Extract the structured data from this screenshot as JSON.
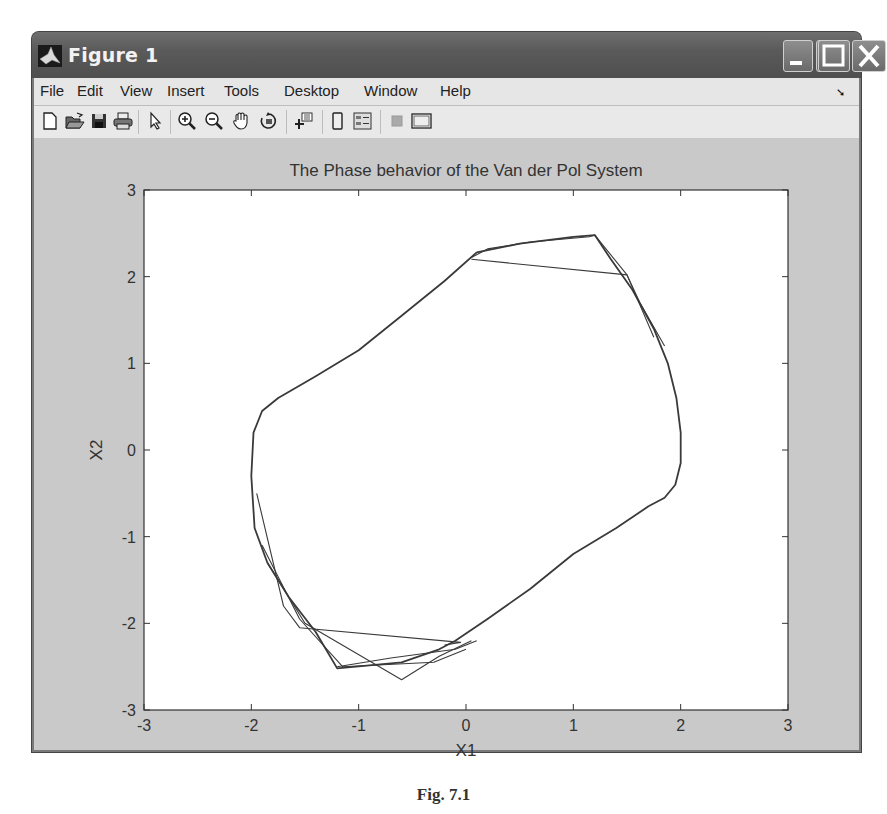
{
  "window": {
    "title": "Figure 1",
    "controls": {
      "minimize": "minimize",
      "maximize": "maximize",
      "close": "close"
    }
  },
  "menubar": {
    "items": [
      "File",
      "Edit",
      "View",
      "Insert",
      "Tools",
      "Desktop",
      "Window",
      "Help"
    ],
    "dock_arrow": "➘"
  },
  "toolbar": {
    "buttons": [
      {
        "name": "new-figure",
        "icon": "new-document-icon"
      },
      {
        "name": "open-file",
        "icon": "folder-open-icon"
      },
      {
        "name": "save-figure",
        "icon": "floppy-disk-icon"
      },
      {
        "name": "print-figure",
        "icon": "printer-icon"
      },
      {
        "name": "edit-plot",
        "icon": "arrow-pointer-icon"
      },
      {
        "name": "zoom-in",
        "icon": "zoom-in-icon"
      },
      {
        "name": "zoom-out",
        "icon": "zoom-out-icon"
      },
      {
        "name": "pan",
        "icon": "hand-icon"
      },
      {
        "name": "rotate-3d",
        "icon": "rotate-icon"
      },
      {
        "name": "data-cursor",
        "icon": "data-cursor-icon"
      },
      {
        "name": "insert-colorbar",
        "icon": "colorbar-icon"
      },
      {
        "name": "insert-legend",
        "icon": "legend-icon"
      },
      {
        "name": "hide-plot-tools",
        "icon": "hide-tools-icon"
      },
      {
        "name": "show-plot-tools",
        "icon": "show-tools-icon"
      }
    ]
  },
  "chart_data": {
    "type": "line",
    "title": "The Phase behavior of the Van der Pol System",
    "xlabel": "X1",
    "ylabel": "X2",
    "xlim": [
      -3,
      3
    ],
    "ylim": [
      -3,
      3
    ],
    "xticks": [
      -3,
      -2,
      -1,
      0,
      1,
      2,
      3
    ],
    "yticks": [
      -3,
      -2,
      -1,
      0,
      1,
      2,
      3
    ],
    "grid": false,
    "line_color": "#3a3a3a",
    "series": [
      {
        "name": "limit-cycle",
        "x": [
          0.1,
          0.5,
          1.0,
          1.2,
          1.35,
          1.55,
          1.75,
          1.88,
          1.96,
          2.0,
          2.0,
          1.95,
          1.85,
          1.7,
          1.4,
          1.0,
          0.6,
          0.2,
          -0.1,
          -0.25,
          -0.6,
          -1.2,
          -1.4,
          -1.65,
          -1.85,
          -1.97,
          -2.0,
          -1.98,
          -1.9,
          -1.75,
          -1.4,
          -1.0,
          -0.6,
          -0.2,
          0.1
        ],
        "y": [
          2.28,
          2.38,
          2.46,
          2.48,
          2.2,
          1.85,
          1.4,
          1.0,
          0.6,
          0.2,
          -0.15,
          -0.4,
          -0.55,
          -0.65,
          -0.9,
          -1.2,
          -1.6,
          -1.95,
          -2.2,
          -2.3,
          -2.45,
          -2.52,
          -2.1,
          -1.7,
          -1.3,
          -0.9,
          -0.3,
          0.2,
          0.45,
          0.6,
          0.85,
          1.15,
          1.55,
          1.95,
          2.28
        ]
      },
      {
        "name": "transient-1",
        "x": [
          0.05,
          0.2,
          0.6,
          1.15,
          1.2,
          1.5,
          1.75
        ],
        "y": [
          2.22,
          2.32,
          2.4,
          2.46,
          2.48,
          2.02,
          1.3
        ]
      },
      {
        "name": "transient-2",
        "x": [
          0.05,
          1.5,
          1.62,
          1.85
        ],
        "y": [
          2.2,
          2.02,
          1.7,
          1.2
        ]
      },
      {
        "name": "transient-3",
        "x": [
          -1.95,
          -1.7,
          -1.55,
          -0.05,
          -0.2
        ],
        "y": [
          -0.5,
          -1.8,
          -2.05,
          -2.22,
          -2.25
        ]
      },
      {
        "name": "transient-4",
        "x": [
          -1.85,
          -1.5,
          -0.6,
          -0.25,
          0.05
        ],
        "y": [
          -1.3,
          -2.0,
          -2.65,
          -2.38,
          -2.2
        ]
      },
      {
        "name": "transient-5",
        "x": [
          -1.9,
          -1.55,
          -1.15,
          -0.3,
          0.0
        ],
        "y": [
          -1.1,
          -1.95,
          -2.5,
          -2.45,
          -2.3
        ]
      },
      {
        "name": "transient-6",
        "x": [
          -1.2,
          -0.7,
          -0.1,
          0.1
        ],
        "y": [
          -2.5,
          -2.4,
          -2.3,
          -2.2
        ]
      }
    ]
  },
  "caption": "Fig. 7.1"
}
